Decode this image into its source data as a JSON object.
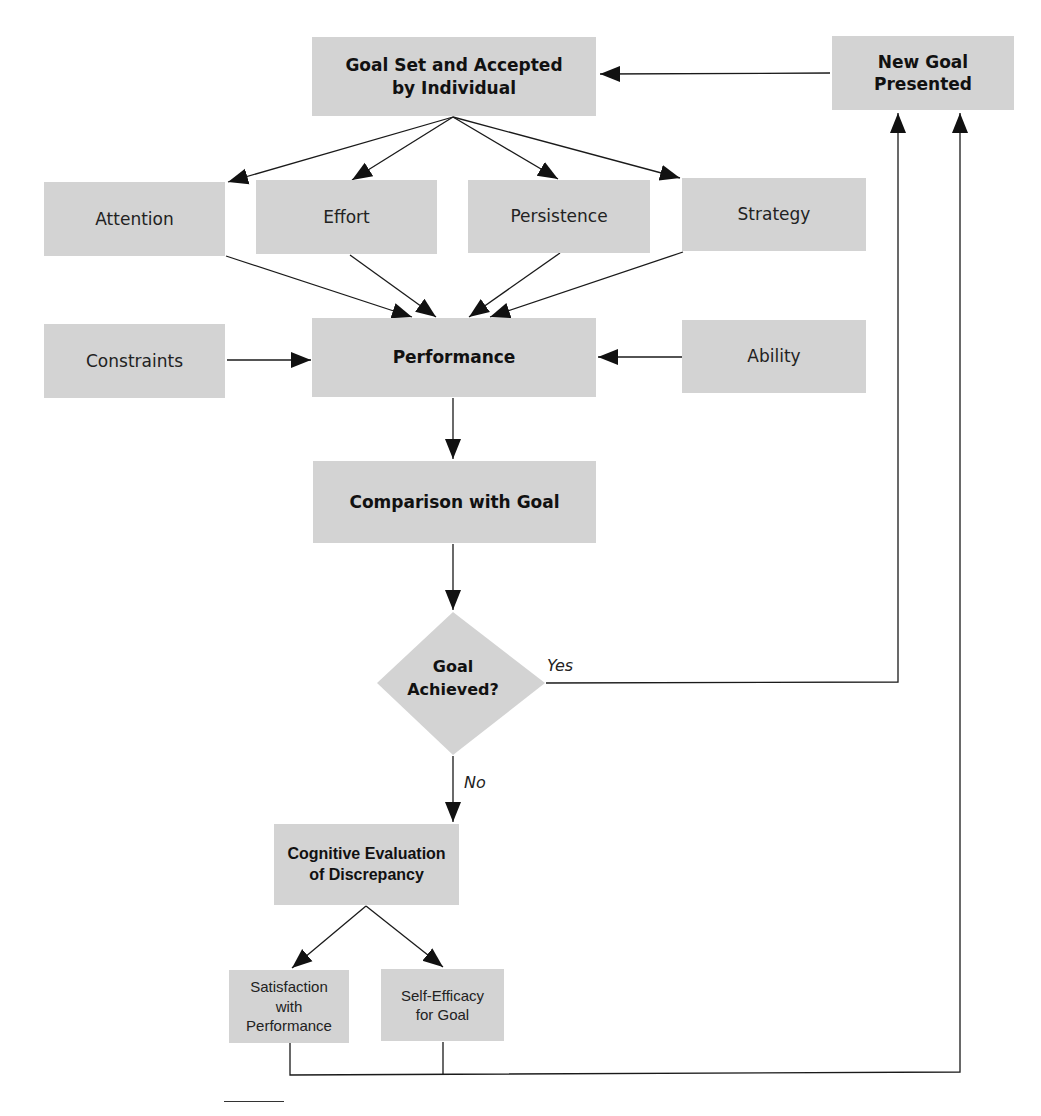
{
  "diagram": {
    "type": "flowchart",
    "nodes": {
      "goal_set": {
        "label_line1": "Goal Set and Accepted",
        "label_line2": "by Individual"
      },
      "new_goal": {
        "label_line1": "New Goal",
        "label_line2": "Presented"
      },
      "attention": {
        "label": "Attention"
      },
      "effort": {
        "label": "Effort"
      },
      "persistence": {
        "label": "Persistence"
      },
      "strategy": {
        "label": "Strategy"
      },
      "constraints": {
        "label": "Constraints"
      },
      "performance": {
        "label": "Performance"
      },
      "ability": {
        "label": "Ability"
      },
      "comparison": {
        "label": "Comparison with Goal"
      },
      "goal_achieved": {
        "label_line1": "Goal",
        "label_line2": "Achieved?"
      },
      "cognitive_eval": {
        "label_line1": "Cognitive Evaluation",
        "label_line2": "of Discrepancy"
      },
      "satisfaction": {
        "label_line1": "Satisfaction",
        "label_line2": "with Performance"
      },
      "self_efficacy": {
        "label_line1": "Self-Efficacy",
        "label_line2": "for Goal"
      }
    },
    "edge_labels": {
      "yes": "Yes",
      "no": "No"
    },
    "edges": [
      {
        "from": "new_goal",
        "to": "goal_set"
      },
      {
        "from": "goal_set",
        "to": "attention"
      },
      {
        "from": "goal_set",
        "to": "effort"
      },
      {
        "from": "goal_set",
        "to": "persistence"
      },
      {
        "from": "goal_set",
        "to": "strategy"
      },
      {
        "from": "attention",
        "to": "performance"
      },
      {
        "from": "effort",
        "to": "performance"
      },
      {
        "from": "persistence",
        "to": "performance"
      },
      {
        "from": "strategy",
        "to": "performance"
      },
      {
        "from": "constraints",
        "to": "performance"
      },
      {
        "from": "ability",
        "to": "performance"
      },
      {
        "from": "performance",
        "to": "comparison"
      },
      {
        "from": "comparison",
        "to": "goal_achieved"
      },
      {
        "from": "goal_achieved",
        "to": "new_goal",
        "label": "Yes"
      },
      {
        "from": "goal_achieved",
        "to": "cognitive_eval",
        "label": "No"
      },
      {
        "from": "cognitive_eval",
        "to": "satisfaction"
      },
      {
        "from": "cognitive_eval",
        "to": "self_efficacy"
      },
      {
        "from": "satisfaction",
        "to": "new_goal"
      },
      {
        "from": "self_efficacy",
        "to": "new_goal"
      }
    ],
    "colors": {
      "box_fill": "#d3d3d3",
      "line": "#1a1a1a",
      "background": "#ffffff"
    }
  }
}
